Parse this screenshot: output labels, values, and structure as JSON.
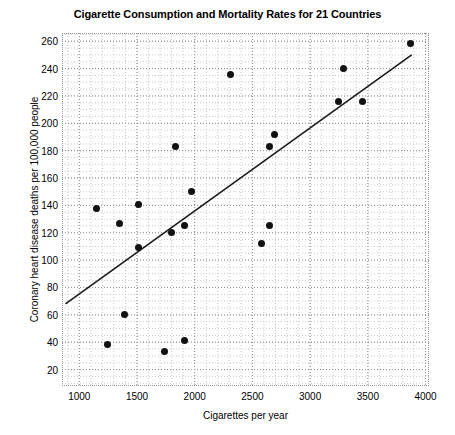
{
  "chart_data": {
    "type": "scatter",
    "title": "Cigarette Consumption and Mortality Rates for 21 Countries",
    "xlabel": "Cigarettes per year",
    "ylabel": "Coronary heart disease deaths per 100,000 people",
    "xlim": [
      850,
      4030
    ],
    "ylim": [
      8,
      266
    ],
    "xticks": [
      1000,
      1500,
      2000,
      2500,
      3000,
      3500,
      4000
    ],
    "yticks": [
      20,
      40,
      60,
      80,
      100,
      120,
      140,
      160,
      180,
      200,
      220,
      240,
      260
    ],
    "xtick_labels": [
      "1000",
      "1500",
      "2000",
      "2500",
      "3000",
      "3500",
      "4000"
    ],
    "ytick_labels": [
      "20",
      "40",
      "60",
      "80",
      "100",
      "120",
      "140",
      "160",
      "180",
      "200",
      "220",
      "240",
      "260"
    ],
    "grid": true,
    "grid_style": "dotted",
    "grid_minor": true,
    "legend": false,
    "marker_color": "#111111",
    "marker_size": 7,
    "line_color": "#1a1a1a",
    "points": [
      {
        "x": 1145,
        "y": 138
      },
      {
        "x": 1245,
        "y": 38
      },
      {
        "x": 1350,
        "y": 127
      },
      {
        "x": 1390,
        "y": 60
      },
      {
        "x": 1510,
        "y": 141
      },
      {
        "x": 1510,
        "y": 109
      },
      {
        "x": 1740,
        "y": 33
      },
      {
        "x": 1800,
        "y": 120
      },
      {
        "x": 1830,
        "y": 183
      },
      {
        "x": 1910,
        "y": 125
      },
      {
        "x": 1910,
        "y": 41
      },
      {
        "x": 1975,
        "y": 150
      },
      {
        "x": 2310,
        "y": 236
      },
      {
        "x": 2580,
        "y": 112
      },
      {
        "x": 2650,
        "y": 183
      },
      {
        "x": 2650,
        "y": 125
      },
      {
        "x": 2690,
        "y": 192
      },
      {
        "x": 3250,
        "y": 216
      },
      {
        "x": 3290,
        "y": 240
      },
      {
        "x": 3450,
        "y": 216
      },
      {
        "x": 3870,
        "y": 258
      }
    ],
    "trendline": {
      "name": "least-squares fit",
      "x_start": 880,
      "y_start": 68,
      "x_end": 3880,
      "y_end": 250
    }
  }
}
